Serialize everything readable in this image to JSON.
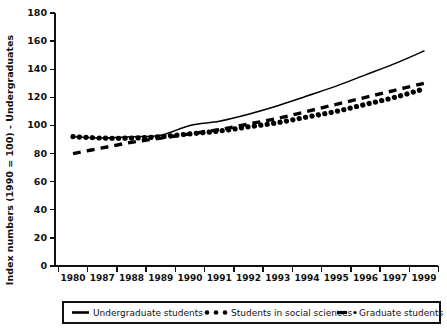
{
  "chart_data": {
    "type": "line",
    "title": "",
    "subtitle": "",
    "xlabel": "",
    "ylabel": "Index numbers (1990 = 100) - Undergraduates",
    "ylim": [
      0,
      180
    ],
    "yticks": [
      0,
      20,
      40,
      60,
      80,
      100,
      120,
      140,
      160,
      180
    ],
    "ytick_labels": [
      "0",
      "20",
      "40",
      "60",
      "80",
      "100",
      "120",
      "140",
      "160",
      "180"
    ],
    "categories": [
      "1980",
      "1987",
      "1988",
      "1989",
      "1990",
      "1991",
      "1992",
      "1993",
      "1994",
      "1995",
      "1996",
      "1997",
      "1999"
    ],
    "grid": false,
    "legend_position": "bottom",
    "series": [
      {
        "name": "Undergraduate students",
        "style": "solid",
        "values": [
          92,
          91,
          92,
          93,
          100,
          103,
          108,
          114,
          121,
          128,
          136,
          144,
          153
        ]
      },
      {
        "name": "Students in social sciences",
        "style": "dotted",
        "values": [
          92,
          91,
          91,
          92,
          94,
          96,
          99,
          102,
          106,
          110,
          115,
          120,
          126
        ]
      },
      {
        "name": "Graduate students",
        "style": "dashed",
        "values": [
          80,
          84,
          88,
          91,
          94,
          97,
          101,
          105,
          110,
          115,
          120,
          125,
          130
        ]
      }
    ],
    "annotations": []
  },
  "legend": {
    "items": [
      {
        "label": "Undergraduate students",
        "marker": "solid-line"
      },
      {
        "label": "Students in social sciences",
        "marker": "dotted-line"
      },
      {
        "label": "Graduate students",
        "marker": "dash-dot-line"
      }
    ]
  }
}
